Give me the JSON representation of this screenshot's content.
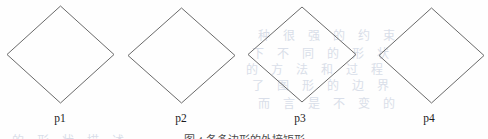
{
  "figure": {
    "kind": "line-drawing",
    "background_color": "#fefefe",
    "stroke_color": "#6a6a6a",
    "stroke_width": 1,
    "label_color": "#1c1c1c",
    "caption": "图 4  各多边形的外接矩形",
    "shapes": [
      {
        "label": "p1",
        "shape": "diamond",
        "center_x": 60,
        "center_y": 54,
        "width": 107,
        "height": 97,
        "label_x": 60,
        "label_y": 113
      },
      {
        "label": "p2",
        "shape": "diamond",
        "center_x": 181,
        "center_y": 55,
        "width": 107,
        "height": 95,
        "label_x": 181,
        "label_y": 113
      },
      {
        "label": "p3",
        "shape": "diamond",
        "center_x": 302,
        "center_y": 54,
        "width": 108,
        "height": 95,
        "label_x": 300,
        "label_y": 113
      },
      {
        "label": "p4",
        "shape": "diamond",
        "center_x": 431,
        "center_y": 55,
        "width": 105,
        "height": 95,
        "label_x": 429,
        "label_y": 113
      }
    ],
    "bleed_through": {
      "color": "#cdd4e2",
      "lines": [
        {
          "text": "种 很 强 的 约 束",
          "x": 258,
          "y": 26
        },
        {
          "text": "下 不 同 的 形 状",
          "x": 252,
          "y": 44
        },
        {
          "text": "的 方 法 和 过 程",
          "x": 246,
          "y": 60
        },
        {
          "text": "了 图 形 的 边 界",
          "x": 252,
          "y": 76
        },
        {
          "text": "而 言 是 不 变 的",
          "x": 258,
          "y": 94
        },
        {
          "text": "的 形 状 描 述",
          "x": 12,
          "y": 131
        }
      ]
    }
  }
}
